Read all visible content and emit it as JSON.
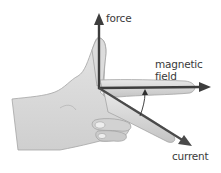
{
  "diagram": {
    "labels": {
      "force": "force",
      "magnetic_field_line1": "magnetic",
      "magnetic_field_line2": "field",
      "current": "current"
    },
    "colors": {
      "arrow": "#3d3d3d",
      "hand_fill": "#d9d9d9",
      "hand_shadow": "#bfbfbf",
      "hand_outline": "#9a9a9a",
      "text": "#3a3a3a",
      "background": "#ffffff"
    },
    "arrows": [
      {
        "name": "force",
        "from": [
          99,
          88
        ],
        "to": [
          99,
          14
        ]
      },
      {
        "name": "magnetic field",
        "from": [
          99,
          88
        ],
        "to": [
          210,
          87
        ]
      },
      {
        "name": "current",
        "from": [
          99,
          88
        ],
        "to": [
          192,
          146
        ]
      }
    ]
  }
}
